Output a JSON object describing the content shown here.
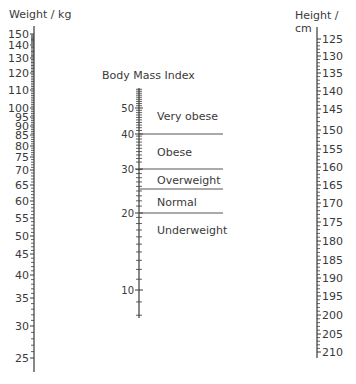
{
  "weight_scale": {
    "label": "Weight / kg",
    "ticks": [
      {
        "v": 150,
        "y": 34
      },
      {
        "v": 140,
        "y": 45
      },
      {
        "v": 130,
        "y": 58
      },
      {
        "v": 120,
        "y": 73
      },
      {
        "v": 110,
        "y": 90
      },
      {
        "v": 100,
        "y": 108
      },
      {
        "v": 95,
        "y": 117
      },
      {
        "v": 90,
        "y": 126
      },
      {
        "v": 85,
        "y": 135
      },
      {
        "v": 80,
        "y": 146
      },
      {
        "v": 75,
        "y": 157
      },
      {
        "v": 70,
        "y": 170
      },
      {
        "v": 65,
        "y": 185
      },
      {
        "v": 60,
        "y": 201
      },
      {
        "v": 55,
        "y": 218
      },
      {
        "v": 50,
        "y": 236
      },
      {
        "v": 45,
        "y": 254
      },
      {
        "v": 40,
        "y": 275
      },
      {
        "v": 35,
        "y": 298
      },
      {
        "v": 30,
        "y": 326
      },
      {
        "v": 25,
        "y": 358
      }
    ],
    "axis_top": 26,
    "axis_bottom": 372
  },
  "bmi_scale": {
    "label": "Body Mass Index",
    "ticks": [
      {
        "v": 50,
        "y": 108
      },
      {
        "v": 40,
        "y": 134
      },
      {
        "v": 30,
        "y": 169
      },
      {
        "v": 20,
        "y": 213
      },
      {
        "v": 10,
        "y": 290
      }
    ],
    "axis_top": 88,
    "axis_bottom": 318,
    "categories": [
      {
        "label": "Very obese",
        "label_y": 116
      },
      {
        "label": "Obese",
        "label_y": 152
      },
      {
        "label": "Overweight",
        "label_y": 180
      },
      {
        "label": "Normal",
        "label_y": 202
      },
      {
        "label": "Underweight",
        "label_y": 230
      }
    ],
    "boundaries": [
      {
        "bmi": 40,
        "y": 134
      },
      {
        "bmi": 30,
        "y": 169
      },
      {
        "bmi": 25,
        "y": 189
      },
      {
        "bmi": 20,
        "y": 213
      }
    ]
  },
  "height_scale": {
    "label": "Height / cm",
    "ticks": [
      {
        "v": 125,
        "y": 39
      },
      {
        "v": 130,
        "y": 56
      },
      {
        "v": 135,
        "y": 73
      },
      {
        "v": 140,
        "y": 91
      },
      {
        "v": 145,
        "y": 109
      },
      {
        "v": 150,
        "y": 130
      },
      {
        "v": 155,
        "y": 149
      },
      {
        "v": 160,
        "y": 167
      },
      {
        "v": 165,
        "y": 185
      },
      {
        "v": 170,
        "y": 203
      },
      {
        "v": 175,
        "y": 222
      },
      {
        "v": 180,
        "y": 241
      },
      {
        "v": 185,
        "y": 260
      },
      {
        "v": 190,
        "y": 278
      },
      {
        "v": 195,
        "y": 296
      },
      {
        "v": 200,
        "y": 315
      },
      {
        "v": 205,
        "y": 334
      },
      {
        "v": 210,
        "y": 352
      }
    ],
    "axis_top": 27,
    "axis_bottom": 358
  },
  "colors": {
    "ink": "#3a3a3a",
    "line": "#555555"
  }
}
